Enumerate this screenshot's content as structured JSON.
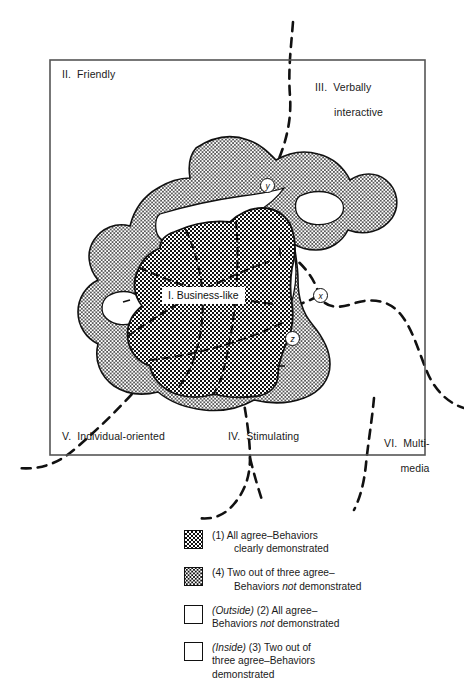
{
  "figure": {
    "type": "perceptual-map",
    "frame": {
      "x": 50,
      "y": 60,
      "width": 375,
      "height": 395
    }
  },
  "regions": [
    {
      "id": "I",
      "label": "I.  Business-like"
    },
    {
      "id": "II",
      "label": "II.  Friendly"
    },
    {
      "id": "III",
      "label_line1": "III.  Verbally",
      "label_line2": "interactive"
    },
    {
      "id": "IV",
      "label": "IV.  Stimulating"
    },
    {
      "id": "V",
      "label": "V.  Individual-oriented"
    },
    {
      "id": "VI",
      "label_line1": "VI.  Multi-",
      "label_line2": "media"
    }
  ],
  "markers": [
    {
      "id": "y",
      "label": "y"
    },
    {
      "id": "x",
      "label": "x"
    },
    {
      "id": "z",
      "label": "z"
    }
  ],
  "legend": {
    "items": [
      {
        "swatch": "dense-checkerboard",
        "line1": "(1)  All agree–Behaviors",
        "line2": "clearly demonstrated",
        "line2_indent": true
      },
      {
        "swatch": "light-dotted",
        "line1": "(4)  Two out of three agree–",
        "line2_pre": "Behaviors ",
        "line2_em": "not",
        "line2_post": " demonstrated",
        "line2_indent": true
      },
      {
        "swatch": "empty-box",
        "line1_em": "(Outside)",
        "line1_post": " (2)  All agree–",
        "line2_pre": "Behaviors ",
        "line2_em": "not",
        "line2_post": " demonstrated"
      },
      {
        "swatch": "empty-box",
        "line1_em": "(Inside)",
        "line1_post": " (3)  Two out of",
        "line2": "three agree–Behaviors",
        "line3": "demonstrated"
      }
    ]
  },
  "colors": {
    "ink": "#111111",
    "paper": "#ffffff"
  }
}
